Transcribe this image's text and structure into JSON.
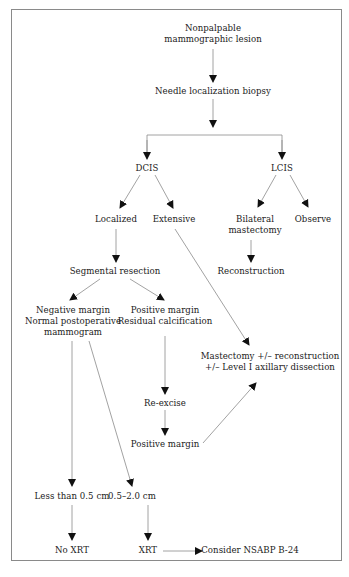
{
  "diagram": {
    "title": "",
    "colors": {
      "line": "#8a8a8a",
      "arrowhead": "#111111",
      "text": "#1a1a1a",
      "frame": "#8a8a8a",
      "background": "#ffffff"
    },
    "nodes": {
      "lesion": {
        "lines": [
          "Nonpalpable",
          "mammographic lesion"
        ]
      },
      "biopsy": {
        "lines": [
          "Needle localization biopsy"
        ]
      },
      "dcis": {
        "lines": [
          "DCIS"
        ]
      },
      "lcis": {
        "lines": [
          "LCIS"
        ]
      },
      "localized": {
        "lines": [
          "Localized"
        ]
      },
      "extensive": {
        "lines": [
          "Extensive"
        ]
      },
      "bilateral": {
        "lines": [
          "Bilateral",
          "mastectomy"
        ]
      },
      "observe": {
        "lines": [
          "Observe"
        ]
      },
      "reconstruction": {
        "lines": [
          "Reconstruction"
        ]
      },
      "segmental": {
        "lines": [
          "Segmental resection"
        ]
      },
      "negative": {
        "lines": [
          "Negative margin",
          "Normal postoperative",
          "mammogram"
        ]
      },
      "positive": {
        "lines": [
          "Positive margin",
          "Residual calcification"
        ]
      },
      "mastectomy": {
        "lines": [
          "Mastectomy +/– reconstruction",
          "+/– Level I axillary dissection"
        ]
      },
      "reexcise": {
        "lines": [
          "Re-excise"
        ]
      },
      "positive2": {
        "lines": [
          "Positive margin"
        ]
      },
      "lt05": {
        "lines": [
          "Less than 0.5 cm"
        ]
      },
      "r0520": {
        "lines": [
          "0.5–2.0 cm"
        ]
      },
      "noxrt": {
        "lines": [
          "No XRT"
        ]
      },
      "xrt": {
        "lines": [
          "XRT"
        ]
      },
      "nsabp": {
        "lines": [
          "Consider NSABP B-24"
        ]
      }
    },
    "edges": [
      {
        "from": "lesion",
        "to": "biopsy"
      },
      {
        "from": "biopsy",
        "to": "dcis"
      },
      {
        "from": "biopsy",
        "to": "lcis"
      },
      {
        "from": "dcis",
        "to": "localized"
      },
      {
        "from": "dcis",
        "to": "extensive"
      },
      {
        "from": "lcis",
        "to": "bilateral"
      },
      {
        "from": "lcis",
        "to": "observe"
      },
      {
        "from": "bilateral",
        "to": "reconstruction"
      },
      {
        "from": "localized",
        "to": "segmental"
      },
      {
        "from": "segmental",
        "to": "negative"
      },
      {
        "from": "segmental",
        "to": "positive"
      },
      {
        "from": "extensive",
        "to": "mastectomy"
      },
      {
        "from": "positive",
        "to": "reexcise"
      },
      {
        "from": "reexcise",
        "to": "positive2"
      },
      {
        "from": "positive2",
        "to": "mastectomy"
      },
      {
        "from": "negative",
        "to": "lt05"
      },
      {
        "from": "negative",
        "to": "r0520"
      },
      {
        "from": "lt05",
        "to": "noxrt"
      },
      {
        "from": "r0520",
        "to": "xrt"
      },
      {
        "from": "xrt",
        "to": "nsabp"
      }
    ]
  }
}
